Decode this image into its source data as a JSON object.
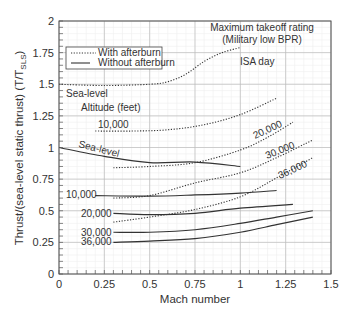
{
  "chart_data": {
    "type": "line",
    "title": "Maximum takeoff rating (Military low BPR)",
    "title_lines": [
      "Maximum takeoff rating",
      "(Military low BPR)"
    ],
    "subtitle": "ISA day",
    "xlabel": "Mach number",
    "ylabel": "Thrust/(sea-level static thrust) (T/T",
    "ylabel_sub": "SLS",
    "ylabel_close": ")",
    "xlim": [
      0,
      1.5
    ],
    "ylim": [
      0,
      2
    ],
    "xticks": [
      "0",
      "0.25",
      "0.5",
      "0.75",
      "1",
      "1.25",
      "1.5"
    ],
    "yticks": [
      "0",
      "0.25",
      "0.5",
      "0.75",
      "1",
      "1.25",
      "1.5",
      "1.75",
      "2"
    ],
    "grid": true,
    "legend": {
      "position": "upper-left",
      "entries": [
        {
          "label": "With afterburn",
          "style": "dotted"
        },
        {
          "label": "Without afterburn",
          "style": "solid"
        }
      ]
    },
    "annotations": {
      "sealevel_ab": "Sea-level",
      "altitude_header": "Altitude (feet)",
      "ab_10000": "10,000",
      "ab_20000": "20,000",
      "ab_30000": "30,000",
      "ab_36000": "36,000",
      "dry_sealevel": "Sea-level",
      "dry_10000": "10,000",
      "dry_20000": "20,000",
      "dry_30000": "30,000",
      "dry_36000": "36,000"
    },
    "series": [
      {
        "name": "With afterburn, Sea-level",
        "style": "dotted",
        "x": [
          0,
          0.25,
          0.5,
          0.6,
          0.7,
          0.8,
          0.9,
          1.0
        ],
        "y": [
          1.5,
          1.49,
          1.5,
          1.52,
          1.58,
          1.68,
          1.75,
          1.79
        ]
      },
      {
        "name": "With afterburn, 10,000 ft",
        "style": "dotted",
        "x": [
          0.2,
          0.4,
          0.6,
          0.8,
          1.0,
          1.2
        ],
        "y": [
          1.13,
          1.13,
          1.14,
          1.18,
          1.26,
          1.39
        ]
      },
      {
        "name": "With afterburn, 20,000 ft",
        "style": "dotted",
        "x": [
          0.3,
          0.5,
          0.75,
          1.0,
          1.15,
          1.29
        ],
        "y": [
          0.84,
          0.85,
          0.88,
          0.98,
          1.08,
          1.2
        ]
      },
      {
        "name": "With afterburn, 30,000 ft",
        "style": "dotted",
        "x": [
          0.3,
          0.5,
          0.75,
          1.0,
          1.2,
          1.4
        ],
        "y": [
          0.6,
          0.62,
          0.72,
          0.8,
          0.92,
          1.06
        ]
      },
      {
        "name": "With afterburn, 36,000 ft",
        "style": "dotted",
        "x": [
          0.3,
          0.5,
          0.75,
          1.0,
          1.2,
          1.4
        ],
        "y": [
          0.41,
          0.45,
          0.51,
          0.61,
          0.76,
          0.92
        ]
      },
      {
        "name": "Without afterburn, Sea-level",
        "style": "solid",
        "x": [
          0,
          0.25,
          0.5,
          0.75,
          1.0
        ],
        "y": [
          1.0,
          0.93,
          0.88,
          0.885,
          0.85
        ]
      },
      {
        "name": "Without afterburn, 10,000 ft",
        "style": "solid",
        "x": [
          0.2,
          0.5,
          0.75,
          1.0,
          1.2
        ],
        "y": [
          0.62,
          0.615,
          0.625,
          0.64,
          0.66
        ]
      },
      {
        "name": "Without afterburn, 20,000 ft",
        "style": "solid",
        "x": [
          0.3,
          0.5,
          0.75,
          1.0,
          1.29
        ],
        "y": [
          0.48,
          0.47,
          0.48,
          0.52,
          0.55
        ]
      },
      {
        "name": "Without afterburn, 30,000 ft",
        "style": "solid",
        "x": [
          0.3,
          0.5,
          0.75,
          1.0,
          1.2,
          1.4
        ],
        "y": [
          0.33,
          0.33,
          0.35,
          0.4,
          0.45,
          0.5
        ]
      },
      {
        "name": "Without afterburn, 36,000 ft",
        "style": "solid",
        "x": [
          0.3,
          0.5,
          0.75,
          1.0,
          1.2,
          1.4
        ],
        "y": [
          0.25,
          0.26,
          0.28,
          0.33,
          0.39,
          0.45
        ]
      }
    ]
  }
}
